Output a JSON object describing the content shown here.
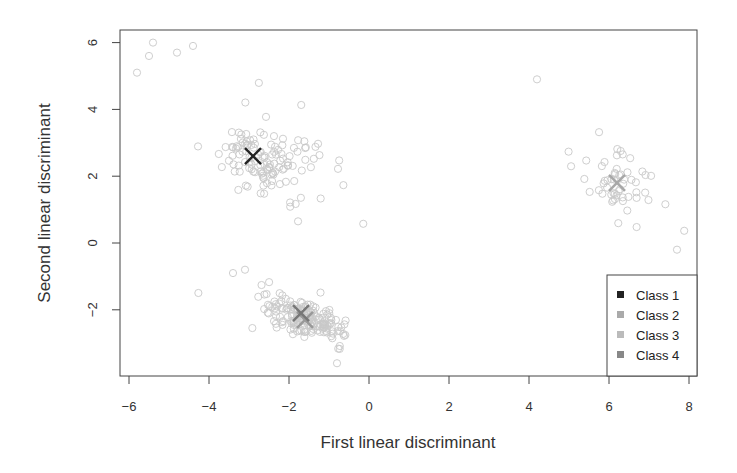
{
  "chart_data": {
    "type": "scatter",
    "title": "",
    "xlabel": "First linear discriminant",
    "ylabel": "Second linear discriminant",
    "xlim": [
      -6.2,
      8.2
    ],
    "ylim": [
      -3.9,
      6.4
    ],
    "xticks": [
      -6,
      -4,
      -2,
      0,
      2,
      4,
      6,
      8
    ],
    "yticks": [
      -2,
      0,
      2,
      4,
      6
    ],
    "grid": false,
    "legend_position": "bottom-right",
    "legend": [
      {
        "label": "Class 1",
        "color": "#222222"
      },
      {
        "label": "Class 2",
        "color": "#aaaaaa"
      },
      {
        "label": "Class 3",
        "color": "#bbbbbb"
      },
      {
        "label": "Class 4",
        "color": "#888888"
      }
    ],
    "centroids": [
      {
        "class": "Class 1",
        "x": -2.9,
        "y": 2.6,
        "color": "#222222"
      },
      {
        "class": "Class 2",
        "x": -1.6,
        "y": -2.3,
        "color": "#999999"
      },
      {
        "class": "Class 3",
        "x": 6.2,
        "y": 1.8,
        "color": "#a8a8a8"
      },
      {
        "class": "Class 4",
        "x": -1.7,
        "y": -2.1,
        "color": "#777777"
      }
    ],
    "clusters": [
      {
        "class": "Class 1",
        "center": [
          -2.6,
          2.5
        ],
        "n": 130,
        "spread": [
          0.8,
          1.1
        ],
        "tilt": -0.9
      },
      {
        "class": "Class 2",
        "center": [
          -1.4,
          -2.4
        ],
        "n": 90,
        "spread": [
          0.5,
          0.4
        ],
        "tilt": -0.4
      },
      {
        "class": "Class 4",
        "center": [
          -1.7,
          -2.1
        ],
        "n": 80,
        "spread": [
          0.6,
          0.5
        ],
        "tilt": -0.5
      },
      {
        "class": "Class 3",
        "center": [
          6.2,
          1.8
        ],
        "n": 55,
        "spread": [
          0.7,
          0.8
        ],
        "tilt": -0.8
      }
    ],
    "outliers": [
      [
        -5.4,
        6.0
      ],
      [
        -5.5,
        5.6
      ],
      [
        -5.8,
        5.1
      ],
      [
        -4.8,
        5.7
      ],
      [
        -4.4,
        5.9
      ],
      [
        4.2,
        4.9
      ],
      [
        7.7,
        -0.2
      ],
      [
        -3.4,
        -0.9
      ],
      [
        -3.1,
        -0.8
      ],
      [
        -0.8,
        -3.6
      ]
    ]
  }
}
